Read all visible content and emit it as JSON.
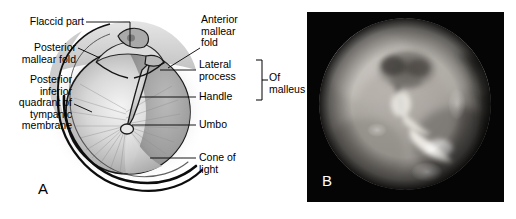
{
  "figure": {
    "background_color": "#ffffff",
    "width": 516,
    "height": 219
  },
  "panel_a": {
    "letter": "A",
    "type": "anatomical-line-drawing",
    "subject": "right tympanic membrane (eardrum) seen through the external auditory canal",
    "ink_color": "#000000",
    "labels_left": [
      {
        "id": "flaccid-part",
        "text": "Flaccid part"
      },
      {
        "id": "posterior-mallear-fold",
        "text": "Posterior\nmallear fold"
      },
      {
        "id": "posterior-inferior-quadrant",
        "text": "Posterior\ninferior\nquadrant of\ntympanic\nmembrane"
      }
    ],
    "labels_right": [
      {
        "id": "anterior-mallear-fold",
        "text": "Anterior\nmallear\nfold"
      },
      {
        "id": "lateral-process",
        "text": "Lateral\nprocess"
      },
      {
        "id": "handle",
        "text": "Handle"
      },
      {
        "id": "umbo",
        "text": "Umbo"
      },
      {
        "id": "cone-of-light",
        "text": "Cone of\nlight"
      }
    ],
    "bracket": {
      "id": "of-malleus-bracket",
      "text": "Of\nmalleus",
      "groups": [
        "Lateral\nprocess",
        "Handle"
      ]
    }
  },
  "panel_b": {
    "letter": "B",
    "type": "otoscopic-photograph",
    "description": "grayscale otoscopic photograph of a tympanic membrane viewed through a circular speculum aperture",
    "frame_color": "#050505",
    "aperture_shape": "circle"
  }
}
